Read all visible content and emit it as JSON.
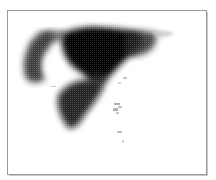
{
  "figure": {
    "type": "density-map",
    "colormap": "grayscale",
    "ink_color": "#000000",
    "background_color": "#ffffff",
    "frame_color": "#9a9a9a",
    "regions": [
      {
        "name": "western-lobe",
        "intensity": "medium-high"
      },
      {
        "name": "central-core",
        "intensity": "very-high"
      },
      {
        "name": "eastern-extension",
        "intensity": "medium"
      },
      {
        "name": "southern-peninsula",
        "intensity": "high"
      },
      {
        "name": "southeast-scatter",
        "intensity": "low"
      }
    ]
  }
}
